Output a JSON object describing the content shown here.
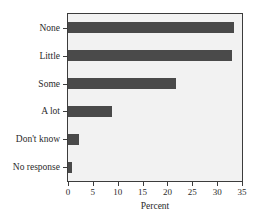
{
  "figure": {
    "title": "",
    "title_visible": false,
    "background_color": "#ffffff",
    "plot_background_color": "#f2f2f2",
    "frame_color": "#3c3c3c",
    "bar_color": "#4a4a4a"
  },
  "chart_data": {
    "type": "bar",
    "orientation": "horizontal",
    "title": "",
    "xlabel": "Percent",
    "ylabel": "",
    "categories": [
      "None",
      "Little",
      "Some",
      "A lot",
      "Don't know",
      "No response"
    ],
    "values": [
      33.4,
      33.0,
      21.7,
      8.8,
      2.3,
      0.8
    ],
    "series": [
      {
        "name": "Percent",
        "values": [
          33.4,
          33.0,
          21.7,
          8.8,
          2.3,
          0.8
        ]
      }
    ],
    "xlim": [
      0,
      35
    ],
    "xticks": [
      0,
      5,
      10,
      15,
      20,
      25,
      30,
      35
    ],
    "xticklabels": [
      "0",
      "5",
      "10",
      "15",
      "20",
      "25",
      "30",
      "35"
    ],
    "grid": false,
    "legend": false,
    "legend_position": "none",
    "bar_color": "#4a4a4a"
  }
}
